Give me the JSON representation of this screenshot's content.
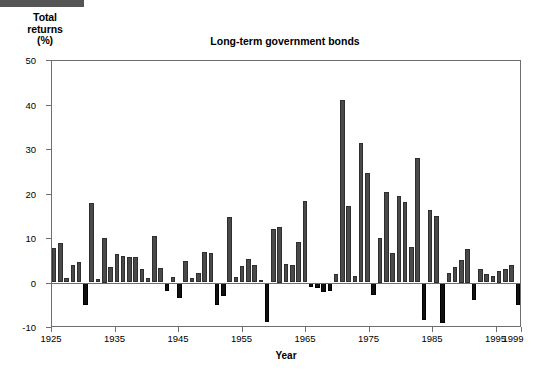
{
  "header": {
    "strip_color": "#555555"
  },
  "axis_caption": {
    "line1": "Total",
    "line2": "returns",
    "line3": "(%)"
  },
  "colors": {
    "positive_bar": "#4a4a4a",
    "negative_bar": "#111111",
    "axis": "#6e6e6e",
    "text": "#000000"
  },
  "chart_data": {
    "type": "bar",
    "title": "Long-term government bonds",
    "xlabel": "Year",
    "ylabel": "Total returns (%)",
    "ylim": [
      -10,
      50
    ],
    "yticks": [
      -10,
      0,
      10,
      20,
      30,
      40,
      50
    ],
    "xlim": [
      1925,
      1999
    ],
    "xticks": [
      1925,
      1935,
      1945,
      1955,
      1965,
      1975,
      1985,
      1995,
      1999
    ],
    "xtick_labels": [
      "1925",
      "1935",
      "1945",
      "1955",
      "1965",
      "1975",
      "1985",
      "1995",
      "1999"
    ],
    "grid": false,
    "legend": "none",
    "categories": [
      "1925",
      "1926",
      "1927",
      "1928",
      "1929",
      "1930",
      "1931",
      "1932",
      "1933",
      "1934",
      "1935",
      "1936",
      "1937",
      "1938",
      "1939",
      "1940",
      "1941",
      "1942",
      "1943",
      "1944",
      "1945",
      "1946",
      "1947",
      "1948",
      "1949",
      "1950",
      "1951",
      "1952",
      "1953",
      "1954",
      "1955",
      "1956",
      "1957",
      "1958",
      "1959",
      "1960",
      "1961",
      "1962",
      "1963",
      "1964",
      "1965",
      "1966",
      "1967",
      "1968",
      "1969",
      "1970",
      "1971",
      "1972",
      "1973",
      "1974",
      "1975",
      "1976",
      "1977",
      "1978",
      "1979",
      "1980",
      "1981",
      "1982",
      "1983",
      "1984",
      "1985",
      "1986",
      "1987",
      "1988",
      "1989",
      "1990",
      "1991",
      "1992",
      "1993",
      "1994",
      "1995",
      "1996",
      "1997",
      "1998",
      "1999"
    ],
    "values": [
      7.8,
      8.8,
      0.9,
      4.0,
      4.5,
      -5.0,
      17.8,
      0.8,
      10.0,
      3.4,
      6.4,
      5.9,
      5.8,
      5.8,
      3.0,
      1.0,
      10.5,
      3.2,
      -2.0,
      1.2,
      -3.5,
      4.9,
      1.0,
      2.1,
      6.9,
      6.6,
      -5.0,
      -3.0,
      14.8,
      1.3,
      3.7,
      5.3,
      4.0,
      0.6,
      -8.8,
      12.0,
      12.5,
      4.2,
      4.0,
      9.2,
      18.3,
      -1.1,
      -1.2,
      -2.2,
      -2.0,
      1.8,
      41.0,
      17.3,
      1.4,
      31.4,
      24.5,
      -2.7,
      10.0,
      20.3,
      6.7,
      19.5,
      18.0,
      8.0,
      28.0,
      -8.5,
      16.2,
      15.0,
      -9.0,
      2.2,
      3.4,
      5.0,
      7.5,
      -4.0,
      3.0,
      2.0,
      1.5,
      2.5,
      3.0,
      4.0,
      -5.0
    ]
  },
  "notes": {
    "bar_count": 75
  }
}
